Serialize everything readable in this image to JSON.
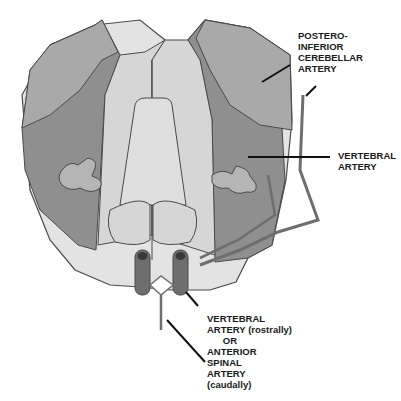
{
  "diagram": {
    "colors": {
      "dark_region": "#8a8a8a",
      "mid_region": "#a9a9a9",
      "light_region": "#d6d6d6",
      "lighter_region": "#e6e6e6",
      "outline": "#4a4a4a",
      "artery": "#6e6e6e",
      "leader_line": "#111111"
    },
    "labels": {
      "pica": "POSTERO-\nINFERIOR\nCEREBELLAR\nARTERY",
      "vertebral": "VERTEBRAL\nARTERY",
      "bottom": "VERTEBRAL\nARTERY (rostrally)\n      OR\nANTERIOR\nSPINAL\nARTERY\n(caudally)"
    }
  }
}
